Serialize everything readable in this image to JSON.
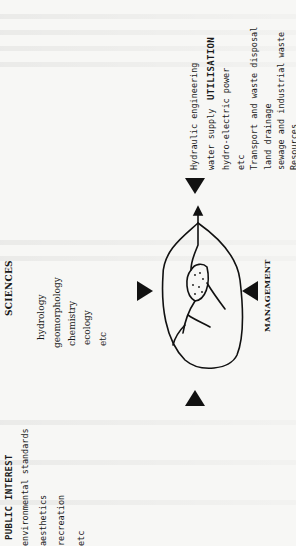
{
  "diagram": {
    "utilisation": {
      "heading": "UTILISATION",
      "items": [
        "Hydraulic engineering",
        "water supply",
        "hydro-electric power",
        "etc",
        "Transport and waste disposal",
        "land drainage",
        "sewage and industrial waste",
        "Resources",
        "fisheries"
      ]
    },
    "sciences": {
      "heading": "SCIENCES",
      "items": [
        "hydrology",
        "geomorphology",
        "chemistry",
        "ecology",
        "etc"
      ]
    },
    "management": {
      "heading": "MANAGEMENT"
    },
    "public_interest": {
      "heading": "PUBLIC INTEREST",
      "items": [
        "environmental standards",
        "aesthetics",
        "recreation",
        "etc"
      ]
    },
    "center_icon": "catchment-drainage-basin-icon",
    "colors": {
      "ink": "#111111",
      "paper": "#f7f7f5"
    }
  }
}
